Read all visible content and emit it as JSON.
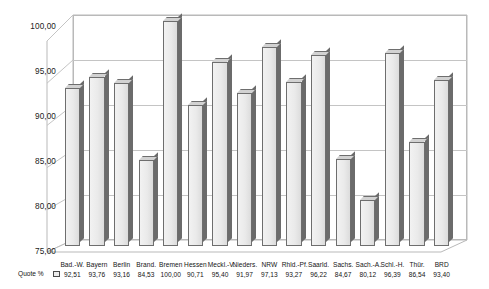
{
  "chart_data": {
    "type": "bar",
    "title": "",
    "subtitle": "",
    "xlabel": "",
    "ylabel": "",
    "ylim": [
      75.0,
      100.0
    ],
    "ytick_labels": [
      "100,00",
      "95,00",
      "90,00",
      "85,00",
      "80,00",
      "75,00"
    ],
    "ytick_values": [
      100.0,
      95.0,
      90.0,
      85.0,
      80.0,
      75.0
    ],
    "grid": true,
    "legend_position": "bottom-left",
    "three_d": true,
    "series_label": "Quote %",
    "categories": [
      "Bad.-W.",
      "Bayern",
      "Berlin",
      "Brand.",
      "Bremen",
      "Hessen",
      "Meckl.-V.",
      "Nieders.",
      "NRW",
      "Rhld.-Pf.",
      "Saarld.",
      "Sachs.",
      "Sach.-A.",
      "Schl.-H.",
      "Thür.",
      "BRD"
    ],
    "values": [
      92.51,
      93.76,
      93.16,
      84.53,
      100.0,
      90.71,
      95.4,
      91.97,
      97.13,
      93.27,
      96.22,
      84.67,
      80.12,
      96.39,
      86.54,
      93.4
    ],
    "value_labels": [
      "92,51",
      "93,76",
      "93,16",
      "84,53",
      "100,00",
      "90,71",
      "95,40",
      "91,97",
      "97,13",
      "93,27",
      "96,22",
      "84,67",
      "80,12",
      "96,39",
      "86,54",
      "93,40"
    ],
    "colors": {
      "bar_face": "#eaeaea",
      "bar_edge": "#6e6e6e",
      "bar_side": "#6b6b6b",
      "bar_top": "#d2d2d2",
      "gridline": "#c4c4c4",
      "axis": "#b9b9b9",
      "text": "#141414",
      "background": "#ffffff"
    }
  }
}
